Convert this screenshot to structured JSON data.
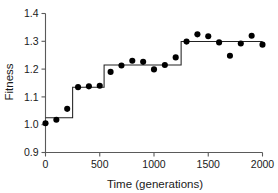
{
  "chart_data": {
    "type": "scatter",
    "title": "",
    "xlabel": "Time (generations)",
    "ylabel": "Fitness",
    "xlim": [
      0,
      2000
    ],
    "ylim": [
      0.9,
      1.4
    ],
    "xticks": [
      0,
      500,
      1000,
      1500,
      2000
    ],
    "xtick_labels": [
      "0",
      "500",
      "1000",
      "1500",
      "2000"
    ],
    "yticks": [
      0.9,
      1.0,
      1.1,
      1.2,
      1.3,
      1.4
    ],
    "ytick_labels": [
      "0.9",
      "1.0",
      "1.1",
      "1.2",
      "1.3",
      "1.4"
    ],
    "grid": false,
    "legend": false,
    "point_color": "#000000",
    "line_color": "#222222",
    "axis_color": "#5a5a5a",
    "series": [
      {
        "name": "Fitness measurements",
        "type": "scatter",
        "x": [
          0,
          100,
          200,
          300,
          400,
          500,
          600,
          700,
          800,
          900,
          1000,
          1100,
          1200,
          1300,
          1400,
          1500,
          1600,
          1700,
          1800,
          1900,
          2000
        ],
        "values": [
          1.005,
          1.018,
          1.057,
          1.135,
          1.138,
          1.14,
          1.19,
          1.213,
          1.23,
          1.226,
          1.199,
          1.215,
          1.242,
          1.299,
          1.325,
          1.318,
          1.296,
          1.248,
          1.292,
          1.32,
          1.288
        ]
      },
      {
        "name": "Step fit",
        "type": "step",
        "steps": [
          {
            "x_start": 0,
            "x_end": 250,
            "level": 1.025
          },
          {
            "x_start": 250,
            "x_end": 540,
            "level": 1.135
          },
          {
            "x_start": 540,
            "x_end": 1250,
            "level": 1.215
          },
          {
            "x_start": 1250,
            "x_end": 2000,
            "level": 1.299
          }
        ]
      }
    ]
  }
}
